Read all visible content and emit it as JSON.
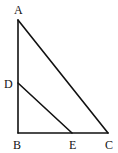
{
  "diagram": {
    "type": "geometry",
    "points": {
      "A": {
        "label": "A",
        "x": 18,
        "y": 20,
        "lx": 14,
        "ly": 14
      },
      "B": {
        "label": "B",
        "x": 18,
        "y": 133,
        "lx": 13,
        "ly": 149
      },
      "C": {
        "label": "C",
        "x": 108,
        "y": 133,
        "lx": 105,
        "ly": 149
      },
      "D": {
        "label": "D",
        "x": 18,
        "y": 83,
        "lx": 4,
        "ly": 88
      },
      "E": {
        "label": "E",
        "x": 72,
        "y": 133,
        "lx": 69,
        "ly": 149
      }
    },
    "segments": [
      {
        "from": "A",
        "to": "B"
      },
      {
        "from": "B",
        "to": "C"
      },
      {
        "from": "A",
        "to": "C"
      },
      {
        "from": "D",
        "to": "E"
      }
    ]
  }
}
